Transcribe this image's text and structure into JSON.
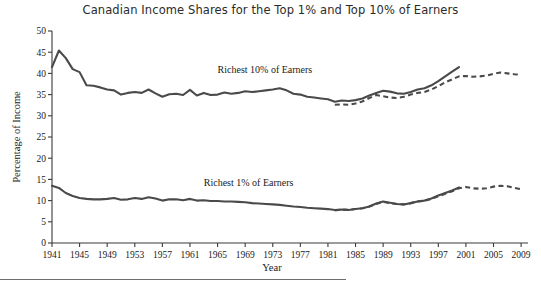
{
  "chart_data": {
    "type": "line",
    "title": "Canadian Income Shares for the Top 1% and Top 10% of Earners",
    "xlabel": "Year",
    "ylabel": "Percentage of Income",
    "xlim": [
      1941,
      2010
    ],
    "ylim": [
      0,
      50
    ],
    "ytick_step": 5,
    "yticks": [
      0,
      5,
      10,
      15,
      20,
      25,
      30,
      35,
      40,
      45,
      50
    ],
    "xticks": [
      1941,
      1945,
      1949,
      1953,
      1957,
      1961,
      1965,
      1969,
      1973,
      1977,
      1981,
      1985,
      1989,
      1993,
      1997,
      2001,
      2005,
      2009
    ],
    "grid": false,
    "legend_position": "inline-annotation",
    "annotations": [
      {
        "text": "Richest 10% of Earners",
        "x": 1965,
        "y": 40.0
      },
      {
        "text": "Richest 1% of Earners",
        "x": 1963,
        "y": 13.5
      }
    ],
    "series": [
      {
        "name": "Richest 10% of Earners",
        "style": "solid",
        "color": "#4a4a4a",
        "x": [
          1941,
          1942,
          1943,
          1944,
          1945,
          1946,
          1947,
          1948,
          1949,
          1950,
          1951,
          1952,
          1953,
          1954,
          1955,
          1956,
          1957,
          1958,
          1959,
          1960,
          1961,
          1962,
          1963,
          1964,
          1965,
          1966,
          1967,
          1968,
          1969,
          1970,
          1971,
          1972,
          1973,
          1974,
          1975,
          1976,
          1977,
          1978,
          1979,
          1980,
          1981,
          1982,
          1983,
          1984,
          1985,
          1986,
          1987,
          1988,
          1989,
          1990,
          1991,
          1992,
          1993,
          1994,
          1995,
          1996,
          1997,
          1998,
          1999,
          2000
        ],
        "values": [
          41.5,
          45.4,
          43.6,
          41.0,
          40.3,
          37.2,
          37.1,
          36.7,
          36.2,
          36.0,
          35.0,
          35.4,
          35.6,
          35.4,
          36.2,
          35.3,
          34.5,
          35.1,
          35.2,
          34.9,
          36.1,
          34.8,
          35.4,
          34.9,
          35.0,
          35.5,
          35.2,
          35.4,
          35.8,
          35.6,
          35.8,
          36.0,
          36.2,
          36.5,
          36.0,
          35.2,
          35.0,
          34.5,
          34.3,
          34.1,
          33.9,
          33.3,
          33.6,
          33.5,
          33.7,
          34.1,
          34.8,
          35.4,
          35.9,
          35.7,
          35.3,
          35.2,
          35.6,
          36.2,
          36.5,
          37.2,
          38.2,
          39.3,
          40.4,
          41.5
        ]
      },
      {
        "name": "Richest 10% of Earners (revised/dashed)",
        "style": "dashed",
        "color": "#4a4a4a",
        "x": [
          1982,
          1983,
          1984,
          1985,
          1986,
          1987,
          1988,
          1989,
          1990,
          1991,
          1992,
          1993,
          1994,
          1995,
          1996,
          1997,
          1998,
          1999,
          2000,
          2001,
          2002,
          2003,
          2004,
          2005,
          2006,
          2007,
          2008,
          2009
        ],
        "values": [
          32.6,
          32.7,
          32.6,
          32.9,
          33.4,
          34.2,
          34.9,
          34.6,
          34.3,
          34.2,
          34.5,
          35.0,
          35.4,
          35.6,
          36.2,
          37.0,
          37.9,
          38.6,
          39.3,
          39.4,
          39.2,
          39.3,
          39.5,
          39.9,
          40.2,
          40.0,
          39.8,
          39.7
        ]
      },
      {
        "name": "Richest 1% of Earners",
        "style": "solid",
        "color": "#4a4a4a",
        "x": [
          1941,
          1942,
          1943,
          1944,
          1945,
          1946,
          1947,
          1948,
          1949,
          1950,
          1951,
          1952,
          1953,
          1954,
          1955,
          1956,
          1957,
          1958,
          1959,
          1960,
          1961,
          1962,
          1963,
          1964,
          1965,
          1966,
          1967,
          1968,
          1969,
          1970,
          1971,
          1972,
          1973,
          1974,
          1975,
          1976,
          1977,
          1978,
          1979,
          1980,
          1981,
          1982,
          1983,
          1984,
          1985,
          1986,
          1987,
          1988,
          1989,
          1990,
          1991,
          1992,
          1993,
          1994,
          1995,
          1996,
          1997,
          1998,
          1999,
          2000
        ],
        "values": [
          13.5,
          13.0,
          11.8,
          11.1,
          10.6,
          10.4,
          10.3,
          10.3,
          10.4,
          10.6,
          10.2,
          10.3,
          10.6,
          10.4,
          10.8,
          10.5,
          10.0,
          10.3,
          10.3,
          10.1,
          10.4,
          10.0,
          10.1,
          9.9,
          9.9,
          9.8,
          9.8,
          9.7,
          9.6,
          9.4,
          9.3,
          9.2,
          9.1,
          9.0,
          8.8,
          8.6,
          8.5,
          8.3,
          8.2,
          8.1,
          8.0,
          7.8,
          7.9,
          7.8,
          8.0,
          8.2,
          8.6,
          9.3,
          9.8,
          9.5,
          9.2,
          9.1,
          9.4,
          9.8,
          10.0,
          10.5,
          11.2,
          11.8,
          12.4,
          13.1
        ]
      },
      {
        "name": "Richest 1% of Earners (revised/dashed)",
        "style": "dashed",
        "color": "#4a4a4a",
        "x": [
          1982,
          1983,
          1984,
          1985,
          1986,
          1987,
          1988,
          1989,
          1990,
          1991,
          1992,
          1993,
          1994,
          1995,
          1996,
          1997,
          1998,
          1999,
          2000,
          2001,
          2002,
          2003,
          2004,
          2005,
          2006,
          2007,
          2008,
          2009
        ],
        "values": [
          7.7,
          7.9,
          7.8,
          8.0,
          8.2,
          8.6,
          9.2,
          9.7,
          9.4,
          9.2,
          9.1,
          9.4,
          9.8,
          10.0,
          10.4,
          11.0,
          11.6,
          12.2,
          12.9,
          13.2,
          12.9,
          12.8,
          12.9,
          13.3,
          13.5,
          13.4,
          13.0,
          12.7
        ]
      }
    ]
  }
}
